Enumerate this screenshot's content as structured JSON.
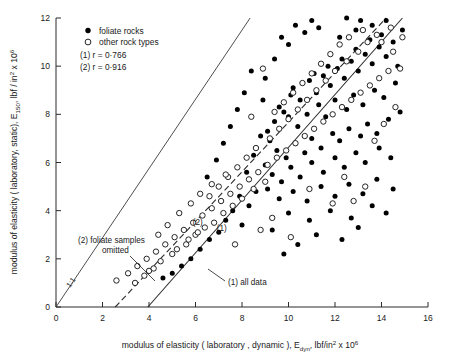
{
  "figure": {
    "axis_color": "#2b2b2b",
    "marker_filled_color": "#000000",
    "marker_open_color": "#ffffff"
  },
  "legend": {
    "items": [
      {
        "marker": "filled-circle",
        "label": "foliate rocks"
      },
      {
        "marker": "open-circle",
        "label": "other rock types"
      }
    ],
    "stats": [
      {
        "label": "(1) r = 0·766"
      },
      {
        "label": "(2) r = 0·916"
      }
    ]
  },
  "annotations": {
    "line1": "(1) all data",
    "line2_a": "(2) foliate  samples",
    "line2_b": "omitted",
    "identity": "1:1"
  },
  "axis_titles": {
    "x_part1": "modulus  of  elasticity ( laboratory , dynamic ), E",
    "x_sub": "dyn",
    "x_part2": ", lbf/in",
    "x_sup1": "2",
    "x_part3": " x 10",
    "x_sup2": "6",
    "y_part1": "modulus  of  elasticity ( laboratory, static), E",
    "y_sub": "150",
    "y_part2": ", lbf / in",
    "y_sup1": "2",
    "y_part3": "  x 10",
    "y_sup2": "6"
  },
  "chart_data": {
    "type": "scatter",
    "title": "",
    "xlabel": "modulus of elasticity (laboratory, dynamic), E_dyn, lbf/in² x 10⁶",
    "ylabel": "modulus of elasticity (laboratory, static), E_150, lbf/in² x 10⁶",
    "xlim": [
      0,
      16
    ],
    "ylim": [
      0,
      12
    ],
    "xticks": [
      0,
      2,
      4,
      6,
      8,
      10,
      12,
      14,
      16
    ],
    "yticks": [
      0,
      2,
      4,
      6,
      8,
      10,
      12
    ],
    "grid": false,
    "legend_position": "top-left",
    "series": [
      {
        "name": "foliate rocks",
        "marker": "filled-circle",
        "points": [
          [
            9.6,
            8.3
          ],
          [
            10.2,
            9.1
          ],
          [
            10.5,
            8.6
          ],
          [
            10.9,
            9.4
          ],
          [
            11.2,
            8.9
          ],
          [
            11.5,
            9.6
          ],
          [
            11.8,
            9.2
          ],
          [
            12.1,
            9.9
          ],
          [
            12.4,
            9.5
          ],
          [
            12.7,
            10.2
          ],
          [
            13.0,
            9.8
          ],
          [
            13.3,
            10.5
          ],
          [
            13.6,
            10.1
          ],
          [
            13.9,
            10.8
          ],
          [
            14.2,
            10.4
          ],
          [
            14.5,
            11.0
          ],
          [
            14.0,
            11.3
          ],
          [
            13.5,
            11.1
          ],
          [
            12.9,
            10.7
          ],
          [
            12.3,
            10.3
          ],
          [
            11.7,
            10.0
          ],
          [
            11.1,
            9.7
          ],
          [
            10.6,
            9.3
          ],
          [
            10.1,
            8.8
          ],
          [
            9.8,
            8.1
          ],
          [
            9.4,
            7.7
          ],
          [
            9.1,
            7.3
          ],
          [
            10.0,
            7.9
          ],
          [
            10.4,
            7.5
          ],
          [
            10.8,
            8.0
          ],
          [
            11.3,
            8.4
          ],
          [
            11.6,
            7.9
          ],
          [
            12.0,
            8.6
          ],
          [
            12.5,
            8.2
          ],
          [
            12.8,
            8.8
          ],
          [
            13.2,
            8.4
          ],
          [
            13.7,
            9.0
          ],
          [
            14.1,
            8.7
          ],
          [
            14.6,
            9.3
          ],
          [
            9.2,
            6.9
          ],
          [
            9.5,
            6.5
          ],
          [
            9.9,
            6.2
          ],
          [
            10.3,
            6.8
          ],
          [
            10.7,
            6.4
          ],
          [
            11.0,
            7.0
          ],
          [
            11.4,
            6.6
          ],
          [
            11.9,
            7.2
          ],
          [
            12.2,
            6.9
          ],
          [
            12.6,
            7.4
          ],
          [
            13.1,
            7.1
          ],
          [
            13.4,
            7.6
          ],
          [
            13.8,
            7.2
          ],
          [
            14.3,
            7.8
          ],
          [
            14.8,
            8.1
          ],
          [
            9.0,
            5.9
          ],
          [
            9.3,
            5.5
          ],
          [
            9.7,
            5.2
          ],
          [
            10.1,
            5.8
          ],
          [
            10.5,
            5.4
          ],
          [
            11.0,
            6.0
          ],
          [
            11.5,
            5.6
          ],
          [
            12.0,
            6.2
          ],
          [
            12.4,
            5.8
          ],
          [
            12.9,
            6.4
          ],
          [
            13.3,
            6.0
          ],
          [
            13.9,
            6.6
          ],
          [
            14.4,
            6.2
          ],
          [
            9.1,
            4.9
          ],
          [
            9.6,
            4.5
          ],
          [
            10.2,
            4.8
          ],
          [
            10.8,
            4.4
          ],
          [
            11.4,
            5.0
          ],
          [
            12.0,
            4.6
          ],
          [
            12.6,
            5.1
          ],
          [
            13.2,
            4.7
          ],
          [
            13.8,
            5.3
          ],
          [
            14.5,
            4.9
          ],
          [
            10.0,
            3.9
          ],
          [
            10.9,
            3.6
          ],
          [
            11.8,
            4.0
          ],
          [
            12.7,
            3.7
          ],
          [
            13.6,
            4.2
          ],
          [
            14.2,
            3.9
          ],
          [
            11.2,
            3.0
          ],
          [
            12.3,
            2.8
          ],
          [
            13.0,
            3.3
          ],
          [
            9.3,
            3.2
          ],
          [
            10.4,
            2.6
          ],
          [
            8.8,
            7.1
          ],
          [
            8.5,
            6.3
          ],
          [
            8.2,
            5.6
          ],
          [
            8.9,
            8.6
          ],
          [
            9.0,
            9.5
          ],
          [
            9.4,
            10.3
          ],
          [
            10.0,
            10.9
          ],
          [
            10.7,
            11.4
          ],
          [
            11.3,
            11.6
          ],
          [
            12.2,
            11.2
          ],
          [
            12.9,
            11.5
          ],
          [
            13.6,
            11.7
          ],
          [
            14.2,
            11.9
          ],
          [
            8.6,
            4.8
          ],
          [
            8.3,
            4.2
          ],
          [
            7.9,
            4.6
          ],
          [
            7.6,
            4.0
          ],
          [
            8.0,
            3.4
          ],
          [
            9.8,
            2.2
          ],
          [
            7.3,
            3.6
          ],
          [
            7.0,
            3.1
          ],
          [
            6.6,
            2.8
          ],
          [
            6.2,
            2.4
          ],
          [
            5.8,
            2.0
          ],
          [
            5.4,
            1.7
          ],
          [
            5.0,
            1.4
          ],
          [
            4.6,
            1.2
          ],
          [
            8.4,
            9.8
          ],
          [
            8.1,
            8.9
          ],
          [
            7.8,
            8.2
          ],
          [
            7.5,
            7.5
          ],
          [
            7.2,
            6.8
          ],
          [
            6.9,
            6.1
          ],
          [
            6.5,
            5.4
          ],
          [
            12.5,
            12.0
          ],
          [
            13.1,
            11.9
          ],
          [
            11.0,
            11.9
          ],
          [
            14.7,
            10.0
          ],
          [
            14.9,
            11.5
          ],
          [
            10.3,
            11.7
          ],
          [
            9.7,
            11.2
          ]
        ]
      },
      {
        "name": "other rock types",
        "marker": "open-circle",
        "points": [
          [
            2.6,
            1.1
          ],
          [
            3.1,
            1.4
          ],
          [
            3.5,
            1.7
          ],
          [
            3.9,
            2.0
          ],
          [
            4.3,
            2.3
          ],
          [
            4.7,
            2.6
          ],
          [
            5.1,
            2.9
          ],
          [
            5.5,
            3.2
          ],
          [
            5.9,
            3.5
          ],
          [
            6.3,
            3.8
          ],
          [
            6.7,
            4.1
          ],
          [
            7.1,
            4.4
          ],
          [
            7.5,
            4.7
          ],
          [
            7.9,
            5.0
          ],
          [
            8.3,
            5.3
          ],
          [
            8.7,
            5.6
          ],
          [
            9.1,
            5.9
          ],
          [
            9.5,
            6.2
          ],
          [
            9.9,
            6.5
          ],
          [
            10.3,
            6.8
          ],
          [
            10.7,
            7.1
          ],
          [
            11.1,
            7.4
          ],
          [
            11.5,
            7.7
          ],
          [
            11.9,
            8.0
          ],
          [
            12.3,
            8.3
          ],
          [
            12.7,
            8.6
          ],
          [
            13.1,
            8.9
          ],
          [
            13.5,
            9.2
          ],
          [
            13.9,
            9.5
          ],
          [
            14.3,
            9.8
          ],
          [
            4.0,
            1.5
          ],
          [
            4.5,
            1.9
          ],
          [
            5.0,
            2.2
          ],
          [
            5.6,
            2.6
          ],
          [
            6.0,
            3.0
          ],
          [
            6.4,
            3.3
          ],
          [
            3.4,
            1.0
          ],
          [
            3.8,
            1.3
          ],
          [
            4.2,
            1.6
          ],
          [
            5.2,
            2.4
          ],
          [
            5.7,
            2.8
          ],
          [
            6.1,
            3.1
          ],
          [
            6.8,
            3.5
          ],
          [
            7.2,
            3.9
          ],
          [
            7.6,
            4.2
          ],
          [
            8.0,
            4.5
          ],
          [
            8.5,
            4.9
          ],
          [
            9.0,
            5.2
          ],
          [
            6.6,
            4.6
          ],
          [
            7.0,
            5.0
          ],
          [
            7.4,
            5.4
          ],
          [
            7.8,
            5.8
          ],
          [
            8.2,
            6.2
          ],
          [
            8.6,
            6.6
          ],
          [
            9.2,
            7.0
          ],
          [
            9.6,
            7.4
          ],
          [
            10.0,
            7.8
          ],
          [
            10.4,
            8.2
          ],
          [
            10.8,
            8.6
          ],
          [
            11.2,
            9.0
          ],
          [
            11.6,
            9.4
          ],
          [
            12.0,
            9.8
          ],
          [
            12.5,
            10.2
          ],
          [
            13.0,
            10.6
          ],
          [
            13.4,
            11.0
          ],
          [
            13.8,
            11.3
          ],
          [
            5.3,
            3.9
          ],
          [
            5.8,
            4.3
          ],
          [
            6.2,
            4.7
          ],
          [
            6.7,
            5.1
          ],
          [
            7.3,
            5.5
          ],
          [
            4.8,
            3.4
          ],
          [
            4.4,
            3.0
          ],
          [
            9.4,
            8.1
          ],
          [
            9.8,
            8.5
          ],
          [
            10.2,
            8.9
          ],
          [
            10.6,
            9.3
          ],
          [
            11.0,
            9.7
          ],
          [
            11.4,
            10.1
          ],
          [
            11.8,
            10.5
          ],
          [
            12.2,
            10.9
          ],
          [
            12.6,
            11.2
          ],
          [
            13.2,
            11.5
          ],
          [
            14.0,
            11.0
          ],
          [
            14.5,
            10.6
          ],
          [
            14.8,
            9.9
          ],
          [
            12.4,
            5.4
          ],
          [
            13.3,
            5.0
          ],
          [
            11.9,
            4.3
          ],
          [
            10.9,
            4.9
          ],
          [
            14.6,
            8.3
          ],
          [
            14.1,
            7.6
          ],
          [
            13.7,
            6.9
          ],
          [
            12.8,
            4.4
          ],
          [
            9.3,
            3.7
          ],
          [
            8.8,
            3.2
          ],
          [
            10.1,
            2.9
          ],
          [
            7.7,
            2.6
          ],
          [
            14.4,
            11.6
          ],
          [
            14.9,
            11.2
          ],
          [
            8.9,
            9.9
          ],
          [
            8.4,
            7.9
          ]
        ]
      }
    ],
    "reference_lines": [
      {
        "name": "identity",
        "label": "1:1",
        "style": "solid",
        "x": [
          0,
          8.35
        ],
        "y": [
          0,
          12
        ]
      },
      {
        "name": "regression-2-foliate-omitted",
        "label": "(2)",
        "style": "dashed",
        "x": [
          2.55,
          14.2
        ],
        "y": [
          0,
          12
        ]
      },
      {
        "name": "regression-1-all-data",
        "label": "(1)",
        "style": "solid",
        "x": [
          3.95,
          14.9
        ],
        "y": [
          0,
          12
        ]
      }
    ]
  }
}
